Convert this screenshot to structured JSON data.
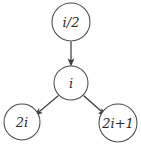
{
  "diagram": {
    "type": "binary-heap-index-relationship",
    "title": "",
    "background_color": "#ffffff",
    "node_stroke_color": "#4a4a4a",
    "edge_color": "#3d3d3d",
    "label_color": "#2b2b2b",
    "nodes": [
      {
        "id": "parent",
        "label": "i/2",
        "label_parts": {
          "lead": "i",
          "op": "/",
          "tail": "2"
        },
        "cx": 71,
        "cy": 22,
        "r": 19
      },
      {
        "id": "self",
        "label": "i",
        "label_parts": {
          "lead": "i",
          "op": "",
          "tail": ""
        },
        "cx": 71,
        "cy": 83,
        "r": 17
      },
      {
        "id": "left-child",
        "label": "2i",
        "label_parts": {
          "lead": "2i",
          "op": "",
          "tail": ""
        },
        "cx": 22,
        "cy": 122,
        "r": 18
      },
      {
        "id": "right-child",
        "label": "2i+1",
        "label_parts": {
          "lead": "2i",
          "op": "+",
          "tail": "1"
        },
        "cx": 118,
        "cy": 123,
        "r": 19
      }
    ],
    "edges": [
      {
        "id": "parent-to-self",
        "from": "parent",
        "to": "self",
        "direction": "down",
        "arrowhead": true
      },
      {
        "id": "self-to-left-child",
        "from": "self",
        "to": "left-child",
        "direction": "down-left",
        "arrowhead": true
      },
      {
        "id": "self-to-right-child",
        "from": "self",
        "to": "right-child",
        "direction": "down-right",
        "arrowhead": true
      }
    ]
  }
}
